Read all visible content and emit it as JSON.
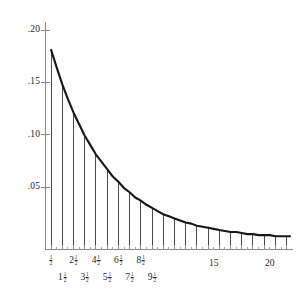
{
  "chart_data": {
    "type": "area",
    "title": "",
    "subtitle": "",
    "xlabel": "",
    "ylabel": "",
    "xlim": [
      0,
      21.8
    ],
    "ylim": [
      0,
      0.215
    ],
    "grid": false,
    "legend": null,
    "curve": {
      "name": "exponential density",
      "form": "f(x) = 0.2 * exp(-0.2 * x)",
      "amplitude": 0.2,
      "rate": 0.2,
      "x_start": 0.5,
      "x_end": 21.8,
      "points_x": [
        0.5,
        1,
        1.5,
        2,
        2.5,
        3,
        3.5,
        4,
        4.5,
        5,
        5.5,
        6,
        6.5,
        7,
        7.5,
        8,
        8.5,
        9,
        9.5,
        10,
        10.5,
        11,
        11.5,
        12,
        12.5,
        13,
        13.5,
        14,
        14.5,
        15,
        15.5,
        16,
        16.5,
        17,
        17.5,
        18,
        18.5,
        19,
        19.5,
        20,
        20.5,
        21,
        21.5,
        21.8
      ],
      "points_y": [
        0.181,
        0.164,
        0.148,
        0.134,
        0.121,
        0.11,
        0.099,
        0.09,
        0.081,
        0.074,
        0.067,
        0.06,
        0.055,
        0.049,
        0.045,
        0.04,
        0.037,
        0.033,
        0.03,
        0.027,
        0.024,
        0.022,
        0.02,
        0.018,
        0.016,
        0.015,
        0.013,
        0.012,
        0.011,
        0.01,
        0.009,
        0.008,
        0.007,
        0.007,
        0.006,
        0.005,
        0.005,
        0.004,
        0.004,
        0.004,
        0.003,
        0.003,
        0.003,
        0.003
      ]
    },
    "riemann_lines": {
      "description": "vertical ordinates drawn from the x-axis up to the curve at half-integer abscissae",
      "x_values": [
        0.5,
        1.5,
        2.5,
        3.5,
        4.5,
        5.5,
        6.5,
        7.5,
        8.5,
        9.5,
        10.5,
        11.5,
        12.5,
        13.5,
        14.5,
        15.5,
        16.5,
        17.5,
        18.5,
        19.5,
        20.5,
        21.5
      ],
      "heights": [
        0.181,
        0.148,
        0.121,
        0.099,
        0.081,
        0.067,
        0.055,
        0.045,
        0.037,
        0.03,
        0.024,
        0.02,
        0.016,
        0.013,
        0.011,
        0.009,
        0.007,
        0.006,
        0.005,
        0.004,
        0.003,
        0.003
      ]
    },
    "y_axis": {
      "tick_values": [
        0.05,
        0.1,
        0.15,
        0.2
      ],
      "tick_labels": [
        ".05",
        ".10",
        ".15",
        ".20"
      ]
    },
    "x_axis": {
      "major_tick_values": [
        0.5,
        1.5,
        2.5,
        3.5,
        4.5,
        5.5,
        6.5,
        7.5,
        8.5,
        9.5,
        10.5,
        11.5,
        12.5,
        13.5,
        14.5,
        15.5,
        16.5,
        17.5,
        18.5,
        19.5,
        20.5,
        21.5
      ],
      "minor_tick_values": [
        1,
        2,
        3,
        4,
        5,
        6,
        7,
        8,
        9,
        10,
        11,
        12,
        13,
        14,
        15,
        16,
        17,
        18,
        19,
        20,
        21
      ],
      "fraction_labels_row1": [
        {
          "x": 0.5,
          "whole": "",
          "num": "1",
          "den": "2"
        },
        {
          "x": 2.5,
          "whole": "2",
          "num": "1",
          "den": "2"
        },
        {
          "x": 4.5,
          "whole": "4",
          "num": "1",
          "den": "2"
        },
        {
          "x": 6.5,
          "whole": "6",
          "num": "1",
          "den": "2"
        },
        {
          "x": 8.5,
          "whole": "8",
          "num": "1",
          "den": "2"
        }
      ],
      "fraction_labels_row2": [
        {
          "x": 1.5,
          "whole": "1",
          "num": "1",
          "den": "2"
        },
        {
          "x": 3.5,
          "whole": "3",
          "num": "1",
          "den": "2"
        },
        {
          "x": 5.5,
          "whole": "5",
          "num": "1",
          "den": "2"
        },
        {
          "x": 7.5,
          "whole": "7",
          "num": "1",
          "den": "2"
        },
        {
          "x": 9.5,
          "whole": "9",
          "num": "1",
          "den": "2"
        }
      ],
      "integer_labels": [
        {
          "x": 15,
          "label": "15"
        },
        {
          "x": 20,
          "label": "20"
        }
      ]
    },
    "colors": {
      "curve": "#161616",
      "riemann": "#2a2a2a",
      "axis": "#8a8a8a",
      "text": "#1f1f1f",
      "background": "#ffffff"
    }
  }
}
